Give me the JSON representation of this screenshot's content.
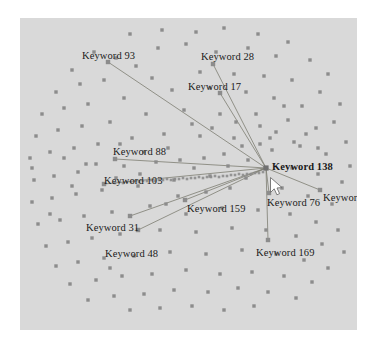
{
  "figure": {
    "type": "network-graph",
    "background_color": "#ffffff",
    "plot_background_color": "#d9d9d9",
    "node_color": "#8c8c8c",
    "edge_color": "#7a7a6e",
    "label_color": "#1a1a1a",
    "hub_marker_color": "#707070"
  },
  "chart_data": {
    "type": "scatter",
    "title": "",
    "xlabel": "",
    "ylabel": "",
    "grid": false,
    "legend": null,
    "hub": {
      "label": "Keyword 138",
      "x": 246,
      "y": 150,
      "bold": true
    },
    "labeled_nodes": [
      {
        "label": "Keyword 93",
        "label_x": 62,
        "label_y": 33,
        "node_x": 88,
        "node_y": 44
      },
      {
        "label": "Keyword 28",
        "label_x": 181,
        "label_y": 34,
        "node_x": 193,
        "node_y": 46
      },
      {
        "label": "Keyword 17",
        "label_x": 168,
        "label_y": 64,
        "node_x": 200,
        "node_y": 75
      },
      {
        "label": "Keyword 88",
        "label_x": 93,
        "label_y": 129,
        "node_x": 95,
        "node_y": 141
      },
      {
        "label": "Keyword 103",
        "label_x": 84,
        "label_y": 158,
        "node_x": 84,
        "node_y": 166
      },
      {
        "label": "Keyword 159",
        "label_x": 167,
        "label_y": 186,
        "node_x": 165,
        "node_y": 182
      },
      {
        "label": "Keyword 31",
        "label_x": 66,
        "label_y": 205,
        "node_x": 110,
        "node_y": 198
      },
      {
        "label": "Keyword 48",
        "label_x": 85,
        "label_y": 231,
        "node_x": 118,
        "node_y": 212
      },
      {
        "label": "Keyword 76",
        "label_x": 247,
        "label_y": 180,
        "node_x": 249,
        "node_y": 175
      },
      {
        "label": "Keyword 108",
        "label_x": 303,
        "label_y": 175,
        "node_x": 300,
        "node_y": 172
      },
      {
        "label": "Keyword 169",
        "label_x": 236,
        "label_y": 230,
        "node_x": 248,
        "node_y": 222
      }
    ],
    "edges": [
      {
        "from": "Keyword 138",
        "to": "Keyword 93"
      },
      {
        "from": "Keyword 138",
        "to": "Keyword 28"
      },
      {
        "from": "Keyword 138",
        "to": "Keyword 17"
      },
      {
        "from": "Keyword 138",
        "to": "Keyword 88"
      },
      {
        "from": "Keyword 138",
        "to": "Keyword 103"
      },
      {
        "from": "Keyword 138",
        "to": "Keyword 159"
      },
      {
        "from": "Keyword 138",
        "to": "Keyword 31"
      },
      {
        "from": "Keyword 138",
        "to": "Keyword 48"
      },
      {
        "from": "Keyword 138",
        "to": "Keyword 76"
      },
      {
        "from": "Keyword 138",
        "to": "Keyword 108"
      },
      {
        "from": "Keyword 138",
        "to": "Keyword 169"
      }
    ],
    "unlabeled_nodes": [
      [
        110,
        16
      ],
      [
        142,
        12
      ],
      [
        176,
        14
      ],
      [
        204,
        10
      ],
      [
        238,
        16
      ],
      [
        268,
        24
      ],
      [
        138,
        30
      ],
      [
        166,
        26
      ],
      [
        74,
        34
      ],
      [
        96,
        40
      ],
      [
        52,
        52
      ],
      [
        116,
        48
      ],
      [
        196,
        34
      ],
      [
        228,
        30
      ],
      [
        256,
        38
      ],
      [
        290,
        42
      ],
      [
        308,
        56
      ],
      [
        36,
        74
      ],
      [
        60,
        66
      ],
      [
        84,
        62
      ],
      [
        132,
        60
      ],
      [
        180,
        54
      ],
      [
        214,
        56
      ],
      [
        244,
        58
      ],
      [
        272,
        62
      ],
      [
        300,
        74
      ],
      [
        320,
        86
      ],
      [
        22,
        96
      ],
      [
        44,
        90
      ],
      [
        68,
        86
      ],
      [
        104,
        80
      ],
      [
        152,
        72
      ],
      [
        190,
        70
      ],
      [
        226,
        74
      ],
      [
        254,
        80
      ],
      [
        282,
        88
      ],
      [
        314,
        104
      ],
      [
        16,
        118
      ],
      [
        38,
        112
      ],
      [
        62,
        108
      ],
      [
        90,
        104
      ],
      [
        126,
        96
      ],
      [
        164,
        92
      ],
      [
        200,
        96
      ],
      [
        236,
        96
      ],
      [
        268,
        102
      ],
      [
        296,
        110
      ],
      [
        326,
        124
      ],
      [
        10,
        140
      ],
      [
        30,
        134
      ],
      [
        54,
        130
      ],
      [
        78,
        126
      ],
      [
        112,
        120
      ],
      [
        144,
        116
      ],
      [
        180,
        118
      ],
      [
        214,
        120
      ],
      [
        250,
        120
      ],
      [
        280,
        128
      ],
      [
        306,
        136
      ],
      [
        330,
        148
      ],
      [
        14,
        162
      ],
      [
        34,
        158
      ],
      [
        58,
        154
      ],
      [
        104,
        148
      ],
      [
        136,
        144
      ],
      [
        272,
        150
      ],
      [
        298,
        156
      ],
      [
        322,
        164
      ],
      [
        12,
        184
      ],
      [
        32,
        180
      ],
      [
        56,
        176
      ],
      [
        82,
        172
      ],
      [
        118,
        168
      ],
      [
        154,
        162
      ],
      [
        190,
        158
      ],
      [
        262,
        170
      ],
      [
        288,
        178
      ],
      [
        312,
        186
      ],
      [
        18,
        206
      ],
      [
        40,
        202
      ],
      [
        64,
        198
      ],
      [
        92,
        194
      ],
      [
        130,
        188
      ],
      [
        166,
        196
      ],
      [
        202,
        190
      ],
      [
        238,
        192
      ],
      [
        270,
        196
      ],
      [
        296,
        204
      ],
      [
        318,
        212
      ],
      [
        26,
        228
      ],
      [
        48,
        224
      ],
      [
        72,
        220
      ],
      [
        100,
        216
      ],
      [
        140,
        212
      ],
      [
        176,
        214
      ],
      [
        212,
        210
      ],
      [
        246,
        212
      ],
      [
        276,
        218
      ],
      [
        302,
        226
      ],
      [
        324,
        234
      ],
      [
        36,
        248
      ],
      [
        58,
        244
      ],
      [
        84,
        240
      ],
      [
        114,
        238
      ],
      [
        150,
        234
      ],
      [
        186,
        236
      ],
      [
        222,
        232
      ],
      [
        256,
        236
      ],
      [
        284,
        242
      ],
      [
        308,
        250
      ],
      [
        50,
        266
      ],
      [
        76,
        262
      ],
      [
        102,
        258
      ],
      [
        132,
        256
      ],
      [
        166,
        252
      ],
      [
        200,
        256
      ],
      [
        232,
        254
      ],
      [
        264,
        258
      ],
      [
        292,
        264
      ],
      [
        68,
        282
      ],
      [
        94,
        278
      ],
      [
        124,
        276
      ],
      [
        154,
        272
      ],
      [
        188,
        274
      ],
      [
        218,
        270
      ],
      [
        248,
        274
      ],
      [
        276,
        280
      ],
      [
        110,
        292
      ],
      [
        140,
        290
      ],
      [
        172,
        288
      ],
      [
        204,
        292
      ],
      [
        234,
        288
      ],
      [
        90,
        250
      ],
      [
        210,
        170
      ],
      [
        226,
        160
      ],
      [
        158,
        178
      ],
      [
        186,
        174
      ],
      [
        146,
        186
      ],
      [
        96,
        160
      ],
      [
        120,
        156
      ],
      [
        174,
        150
      ],
      [
        208,
        148
      ],
      [
        228,
        142
      ],
      [
        252,
        132
      ],
      [
        44,
        140
      ],
      [
        66,
        146
      ],
      [
        298,
        130
      ],
      [
        286,
        116
      ],
      [
        264,
        88
      ],
      [
        240,
        108
      ],
      [
        216,
        104
      ],
      [
        192,
        110
      ],
      [
        172,
        106
      ],
      [
        148,
        130
      ],
      [
        124,
        134
      ],
      [
        100,
        126
      ],
      [
        76,
        146
      ],
      [
        52,
        168
      ],
      [
        30,
        196
      ],
      [
        12,
        150
      ],
      [
        160,
        142
      ],
      [
        184,
        140
      ],
      [
        204,
        136
      ],
      [
        222,
        128
      ],
      [
        240,
        126
      ],
      [
        256,
        114
      ],
      [
        274,
        124
      ]
    ],
    "dense_chain_nodes": [
      [
        95,
        165
      ],
      [
        103,
        165
      ],
      [
        111,
        164
      ],
      [
        119,
        164
      ],
      [
        127,
        163
      ],
      [
        135,
        163
      ],
      [
        143,
        162
      ],
      [
        151,
        162
      ],
      [
        159,
        161
      ],
      [
        167,
        161
      ],
      [
        175,
        160
      ],
      [
        183,
        160
      ],
      [
        191,
        159
      ],
      [
        199,
        159
      ],
      [
        207,
        158
      ],
      [
        215,
        157
      ],
      [
        223,
        157
      ],
      [
        231,
        156
      ],
      [
        239,
        155
      ],
      [
        99,
        164
      ],
      [
        107,
        164
      ],
      [
        115,
        163
      ],
      [
        123,
        163
      ],
      [
        131,
        162
      ],
      [
        139,
        162
      ],
      [
        147,
        161
      ],
      [
        155,
        161
      ],
      [
        163,
        160
      ],
      [
        171,
        160
      ],
      [
        179,
        159
      ],
      [
        187,
        159
      ],
      [
        195,
        158
      ],
      [
        203,
        158
      ],
      [
        211,
        157
      ],
      [
        219,
        156
      ],
      [
        227,
        156
      ],
      [
        235,
        155
      ],
      [
        243,
        154
      ]
    ]
  },
  "cursor": {
    "name": "mouse-pointer",
    "x": 250,
    "y": 159
  }
}
